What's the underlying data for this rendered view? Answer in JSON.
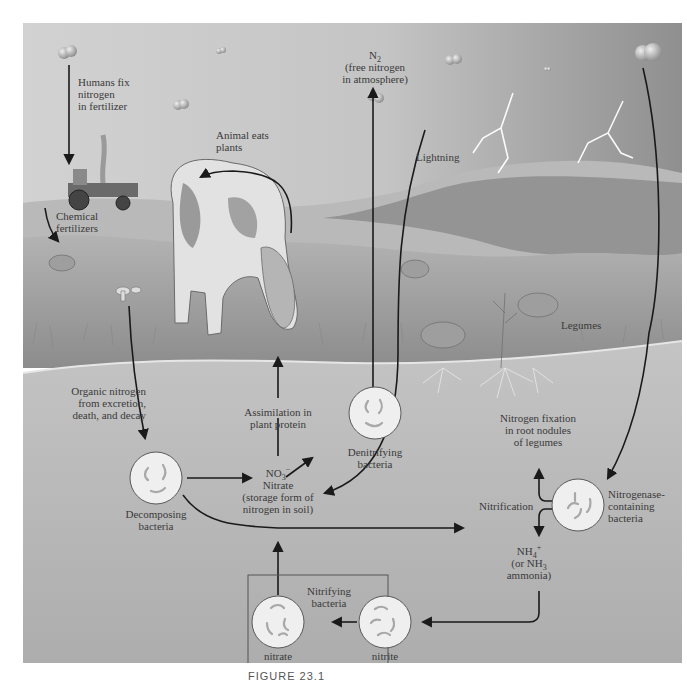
{
  "figure": {
    "caption": "FIGURE 23.1",
    "colors": {
      "sky_top": "#cfcfcf",
      "sky_storm": "#9a9a9a",
      "hill": "#8e8e8e",
      "grass": "#a6a6a6",
      "soil": "#b9b9b9",
      "bacteria_fill": "#efefef",
      "bacteria_stroke": "#5a5a5a",
      "arrow": "#1a1a1a",
      "text": "#3a3a3a"
    }
  },
  "labels": {
    "humans_fix": [
      "Humans fix",
      "nitrogen",
      "in fertilizer"
    ],
    "chemical_fertilizers": [
      "Chemical",
      "fertilizers"
    ],
    "animal_eats_plants": [
      "Animal eats",
      "plants"
    ],
    "n2": {
      "formula": "N",
      "sub": "2",
      "lines": [
        "(free nitrogen",
        "in atmosphere)"
      ]
    },
    "lightning": "Lightning",
    "legumes": "Legumes",
    "organic_nitrogen": [
      "Organic nitrogen",
      "from excretion,",
      "death, and decay"
    ],
    "assimilation": [
      "Assimilation in",
      "plant protein"
    ],
    "denitrifying": [
      "Denitrifying",
      "bacteria"
    ],
    "nitrate": {
      "formula": "NO",
      "sub": "3",
      "sup": "−",
      "lines": [
        "Nitrate",
        "(storage form of",
        "nitrogen in soil)"
      ]
    },
    "decomposing": [
      "Decomposing",
      "bacteria"
    ],
    "nitrogen_fixation": [
      "Nitrogen fixation",
      "in root nodules",
      "of legumes"
    ],
    "nitrification": "Nitrification",
    "nitrogenase": [
      "Nitrogenase-",
      "containing",
      "bacteria"
    ],
    "ammonium": {
      "formula": "NH",
      "sub": "4",
      "sup": "+",
      "line2_prefix": "(or NH",
      "line2_sub": "3",
      "line3": "ammonia)"
    },
    "nitrifying": [
      "Nitrifying",
      "bacteria"
    ],
    "nitrate_bacteria": [
      "nitrate",
      "bacteria"
    ],
    "nitrite_bacteria": [
      "nitrite",
      "bacteria"
    ]
  }
}
